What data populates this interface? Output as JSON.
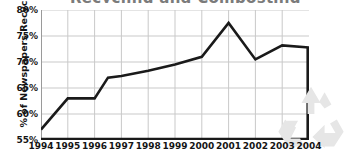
{
  "chart_data": {
    "type": "line",
    "title": "Recycling and Composting",
    "xlabel": "",
    "ylabel": "% of Newspapers Recycled",
    "categories": [
      "1994",
      "1995",
      "1996",
      "1997",
      "1998",
      "1999",
      "2000",
      "2001",
      "2002",
      "2003",
      "2004"
    ],
    "x": [
      1994,
      1995,
      1996,
      1997,
      1998,
      1999,
      2000,
      2001,
      2002,
      2003,
      2004
    ],
    "values": [
      57.0,
      63.0,
      63.0,
      67.3,
      68.3,
      69.5,
      71.0,
      77.5,
      70.5,
      73.2,
      72.8
    ],
    "series": [
      {
        "name": "% of Newspapers Recycled",
        "values": [
          57.0,
          63.0,
          63.0,
          67.3,
          68.3,
          69.5,
          71.0,
          77.5,
          70.5,
          73.2,
          72.8
        ]
      }
    ],
    "extra_vertices": [
      {
        "x": 1996.5,
        "y": 67.0,
        "note": "bend between 1996 and 1997"
      }
    ],
    "ylim": [
      55,
      80
    ],
    "xlim": [
      1994,
      2004
    ],
    "yticks": [
      55,
      60,
      65,
      70,
      75,
      80
    ],
    "ytick_labels": [
      "55%",
      "60%",
      "65%",
      "70%",
      "75%",
      "80%"
    ],
    "xtick_labels": [
      "1994",
      "1995",
      "1996",
      "1997",
      "1998",
      "1999",
      "2000",
      "2001",
      "2002",
      "2003",
      "2004"
    ],
    "grid": true,
    "grid_color": "#c9c9c9",
    "legend": null,
    "legend_position": "none",
    "line_color": "#1a1a1a",
    "line_width": 2.6,
    "axis_color": "#1a1a1a",
    "background_color": "#ffffff",
    "annotations": [
      {
        "name": "recycle-watermark",
        "text": "recycle-icon",
        "color": "#e8e8e8"
      }
    ]
  },
  "figure": {
    "title_clipped": "Recycling and Composting",
    "watermark_label": "recycle-icon",
    "watermark_color": "#e8e8e8"
  }
}
